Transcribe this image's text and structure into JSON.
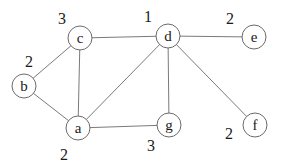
{
  "graph": {
    "nodes": [
      {
        "id": "a",
        "label": "a",
        "x": 78,
        "y": 128,
        "weight": "2",
        "wx": 60,
        "wy": 160
      },
      {
        "id": "b",
        "label": "b",
        "x": 24,
        "y": 86,
        "weight": "2",
        "wx": 25,
        "wy": 67
      },
      {
        "id": "c",
        "label": "c",
        "x": 80,
        "y": 38,
        "weight": "3",
        "wx": 58,
        "wy": 24
      },
      {
        "id": "d",
        "label": "d",
        "x": 168,
        "y": 36,
        "weight": "1",
        "wx": 144,
        "wy": 22
      },
      {
        "id": "e",
        "label": "e",
        "x": 254,
        "y": 37,
        "weight": "2",
        "wx": 226,
        "wy": 24
      },
      {
        "id": "f",
        "label": "f",
        "x": 255,
        "y": 125,
        "weight": "2",
        "wx": 225,
        "wy": 139
      },
      {
        "id": "g",
        "label": "g",
        "x": 169,
        "y": 125,
        "weight": "3",
        "wx": 147,
        "wy": 151
      }
    ],
    "edges": [
      [
        "b",
        "c"
      ],
      [
        "b",
        "a"
      ],
      [
        "c",
        "a"
      ],
      [
        "c",
        "d"
      ],
      [
        "d",
        "e"
      ],
      [
        "d",
        "a"
      ],
      [
        "d",
        "g"
      ],
      [
        "d",
        "f"
      ],
      [
        "a",
        "g"
      ]
    ],
    "node_radius": 12
  }
}
